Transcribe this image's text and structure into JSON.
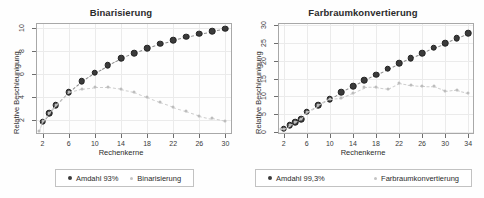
{
  "figure": {
    "background": "#fefefe",
    "panels": [
      "left",
      "right"
    ]
  },
  "chart_data": [
    {
      "type": "scatter",
      "title": "Binarisierung",
      "xlabel": "Rechenkerne",
      "ylabel": "Relative Beschleunigung",
      "xlim": [
        1,
        31
      ],
      "ylim": [
        0.8,
        10.4
      ],
      "xticks": [
        2,
        6,
        10,
        14,
        18,
        22,
        26,
        30
      ],
      "yticks": [
        2,
        4,
        6,
        8,
        10
      ],
      "grid": true,
      "legend_position": "below",
      "series": [
        {
          "name": "Amdahl 93%",
          "color": "#3b3b3b",
          "style": "filled-circle-dashed",
          "x": [
            2,
            3,
            4,
            6,
            8,
            10,
            12,
            14,
            16,
            18,
            20,
            22,
            24,
            26,
            28,
            30
          ],
          "y": [
            1.87,
            2.62,
            3.28,
            4.42,
            5.36,
            6.11,
            6.76,
            7.33,
            7.8,
            8.22,
            8.6,
            8.92,
            9.21,
            9.47,
            9.7,
            9.91
          ]
        },
        {
          "name": "Binarisierung",
          "color": "#bdbdbd",
          "style": "small-circle-dashed",
          "x": [
            1.5,
            2,
            3,
            4,
            6,
            8,
            10,
            12,
            14,
            16,
            18,
            20,
            22,
            24,
            26,
            28,
            30
          ],
          "y": [
            1.05,
            1.9,
            2.62,
            3.28,
            4.42,
            4.7,
            4.85,
            4.86,
            4.72,
            4.45,
            4.0,
            3.55,
            3.15,
            2.78,
            2.4,
            2.15,
            1.93
          ]
        }
      ]
    },
    {
      "type": "scatter",
      "title": "Farbraumkonvertierung",
      "xlabel": "Rechenkerne",
      "ylabel": "Relative Beschleunigung",
      "xlim": [
        1,
        35
      ],
      "ylim": [
        -0.5,
        30.5
      ],
      "xticks": [
        2,
        6,
        10,
        14,
        18,
        22,
        26,
        30,
        34
      ],
      "yticks": [
        0,
        5,
        10,
        15,
        20,
        25,
        30
      ],
      "grid": true,
      "legend_position": "below",
      "series": [
        {
          "name": "Amdahl 99,3%",
          "color": "#3b3b3b",
          "style": "filled-circle-dashed",
          "x": [
            2,
            3,
            4,
            5,
            6,
            8,
            10,
            12,
            14,
            16,
            18,
            20,
            22,
            24,
            26,
            28,
            30,
            32,
            34
          ],
          "y": [
            1.0,
            1.9,
            2.8,
            3.7,
            5.7,
            7.5,
            9.3,
            11.2,
            12.9,
            14.6,
            16.1,
            17.7,
            19.3,
            20.7,
            22.1,
            23.6,
            24.9,
            26.3,
            27.6
          ]
        },
        {
          "name": "Farbraumkonvertierung",
          "color": "#bdbdbd",
          "style": "small-circle-dashed",
          "x": [
            1.5,
            2,
            3,
            4,
            5,
            6,
            8,
            10,
            12,
            14,
            16,
            18,
            20,
            22,
            24,
            26,
            28,
            30,
            32,
            34
          ],
          "y": [
            0.8,
            1.0,
            1.9,
            2.8,
            3.7,
            5.7,
            7.5,
            9.3,
            9.6,
            11.0,
            12.5,
            12.6,
            12.1,
            13.8,
            13.2,
            12.9,
            12.8,
            11.5,
            11.9,
            11.0
          ]
        }
      ]
    }
  ]
}
